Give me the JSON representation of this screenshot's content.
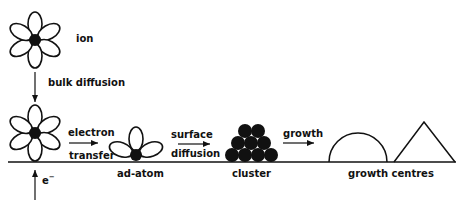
{
  "diagram": {
    "colors": {
      "ink": "#111111",
      "background": "#ffffff"
    },
    "labels": {
      "ion": "ion",
      "bulk_diffusion": "bulk diffusion",
      "electron": "electron",
      "transfer": "transfer",
      "ad_atom": "ad-atom",
      "surface": "surface",
      "diffusion": "diffusion",
      "cluster": "cluster",
      "growth": "growth",
      "growth_centres": "growth centres",
      "electron_symbol": "e",
      "electron_sup": "−"
    },
    "stages": [
      "ion",
      "bulk diffusion",
      "electron transfer",
      "ad-atom",
      "surface diffusion",
      "cluster",
      "growth",
      "growth centres"
    ]
  }
}
